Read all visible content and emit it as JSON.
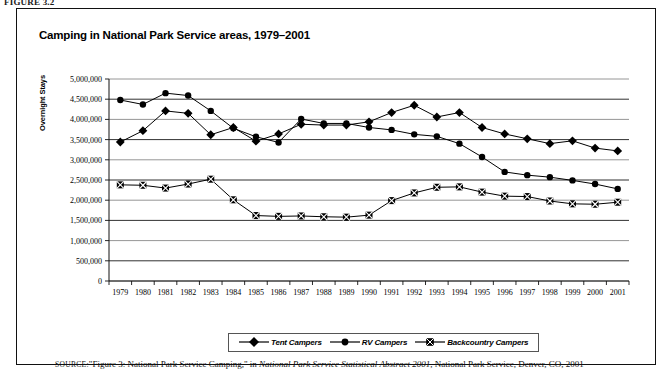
{
  "figure_number": "FIGURE 3.2",
  "chart": {
    "title": "Camping in National Park Service areas, 1979–2001",
    "ylabel": "Overnight Stays"
  },
  "legend": {
    "items": [
      {
        "label": "Tent Campers",
        "marker": "diamond-marker",
        "color": "#000000"
      },
      {
        "label": "RV Campers",
        "marker": "circle-marker",
        "color": "#000000"
      },
      {
        "label": "Backcountry Campers",
        "marker": "crossed-square-marker",
        "color": "#000000"
      }
    ]
  },
  "source": {
    "prefix": "SOURCE:",
    "text_1": "\"Figure 3: National Park Service Camping,\" in ",
    "italic_1": "National Park Service Statistical Abstract 2001",
    "text_2": ", National Park Service, Denver, CO, 2001"
  },
  "chart_data": {
    "type": "line",
    "title": "Camping in National Park Service areas, 1979–2001",
    "xlabel": "",
    "ylabel": "Overnight Stays",
    "ylim": [
      0,
      5000000
    ],
    "ytick_step": 500000,
    "ytick_labels": [
      "0",
      "500,000",
      "1,000,000",
      "1,500,000",
      "2,000,000",
      "2,500,000",
      "3,000,000",
      "3,500,000",
      "4,000,000",
      "4,500,000",
      "5,000,000"
    ],
    "grid": true,
    "legend_position": "bottom",
    "categories": [
      1979,
      1980,
      1981,
      1982,
      1983,
      1984,
      1985,
      1986,
      1987,
      1988,
      1989,
      1990,
      1991,
      1992,
      1993,
      1994,
      1995,
      1996,
      1997,
      1998,
      1999,
      2000,
      2001
    ],
    "series": [
      {
        "name": "Tent Campers",
        "marker": "diamond",
        "values": [
          3440000,
          3720000,
          4210000,
          4150000,
          3620000,
          3800000,
          3460000,
          3640000,
          3880000,
          3860000,
          3860000,
          3940000,
          4170000,
          4350000,
          4060000,
          4170000,
          3800000,
          3640000,
          3520000,
          3400000,
          3470000,
          3290000,
          3220000
        ]
      },
      {
        "name": "RV Campers",
        "marker": "circle",
        "values": [
          4480000,
          4370000,
          4650000,
          4590000,
          4210000,
          3780000,
          3570000,
          3430000,
          4010000,
          3900000,
          3900000,
          3800000,
          3740000,
          3630000,
          3580000,
          3400000,
          3070000,
          2700000,
          2620000,
          2570000,
          2490000,
          2400000,
          2280000
        ]
      },
      {
        "name": "Backcountry Campers",
        "marker": "crossed-square",
        "values": [
          2380000,
          2370000,
          2300000,
          2400000,
          2520000,
          2010000,
          1620000,
          1600000,
          1610000,
          1590000,
          1580000,
          1630000,
          1990000,
          2180000,
          2320000,
          2330000,
          2200000,
          2100000,
          2090000,
          1980000,
          1910000,
          1900000,
          1950000
        ]
      }
    ]
  }
}
